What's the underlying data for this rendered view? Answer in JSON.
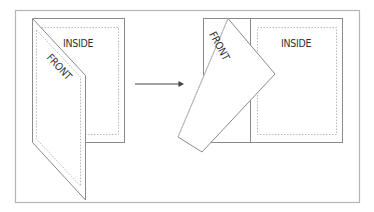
{
  "diagram": {
    "title": "",
    "left": {
      "inside_label": "INSIDE",
      "front_label": "FRONT",
      "state": "card folded closed (front panel angled over inside)"
    },
    "arrow": {
      "direction": "right"
    },
    "right": {
      "inside_label": "INSIDE",
      "front_label": "FRONT",
      "state": "front panel rotated open revealing inside"
    },
    "colors": {
      "frame": "#b5b5b5",
      "outline": "#8a8a8a",
      "dashed": "#a8a8a8",
      "text": "#333333",
      "arrow": "#444444",
      "background": "#ffffff"
    }
  }
}
